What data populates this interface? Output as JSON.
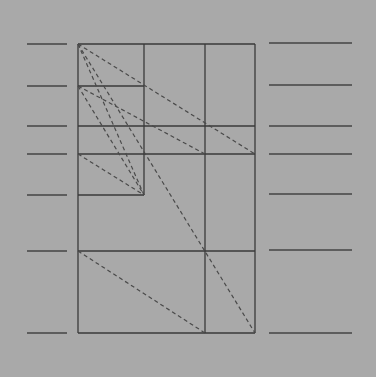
{
  "diagram": {
    "title": "",
    "colors": {
      "background": "#a9a9a9",
      "line": "#3a3a3a"
    },
    "left_guides_count": 7,
    "right_guides_count": 7,
    "dashed_diagonals_count": 8
  }
}
